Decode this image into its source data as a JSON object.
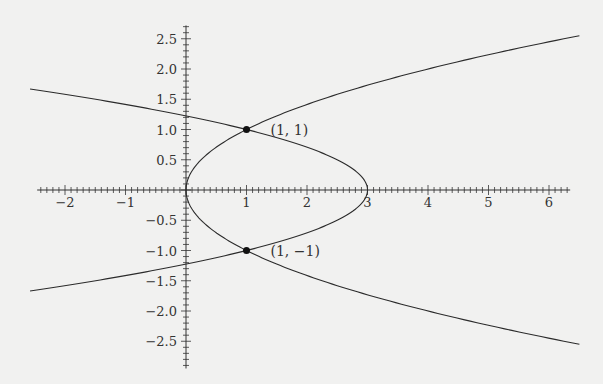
{
  "chart_data": {
    "type": "line",
    "title": "",
    "xlabel": "",
    "ylabel": "",
    "xlim": [
      -2.46,
      6.35
    ],
    "ylim": [
      -2.95,
      2.72
    ],
    "grid": false,
    "x_ticks": [
      -2,
      -1,
      1,
      2,
      3,
      4,
      5,
      6
    ],
    "x_tick_labels": [
      "−2",
      "−1",
      "1",
      "2",
      "3",
      "4",
      "5",
      "6"
    ],
    "y_ticks": [
      2.5,
      2.0,
      1.5,
      1.0,
      0.5,
      -0.5,
      -1.0,
      -1.5,
      -2.0,
      -2.5
    ],
    "y_tick_labels": [
      "2.5",
      "2.0",
      "1.5",
      "1.0",
      "0.5",
      "−0.5",
      "−1.0",
      "−1.5",
      "−2.0",
      "−2.5"
    ],
    "minor_tick_step": 0.1,
    "series": [
      {
        "name": "x = y^2",
        "param": "y",
        "range": [
          -2.55,
          2.55
        ],
        "formula": "y*y"
      },
      {
        "name": "x = 3 - 2y^2",
        "param": "y",
        "range": [
          -1.67,
          1.67
        ],
        "formula": "3-2*y*y"
      }
    ],
    "points": [
      {
        "x": 1,
        "y": 1,
        "label": "(1, 1)"
      },
      {
        "x": 1,
        "y": -1,
        "label": "(1, −1)"
      }
    ],
    "colors": {
      "curve": "#2b2b2b",
      "axis": "#333333",
      "background": "#f1f1f0"
    }
  }
}
